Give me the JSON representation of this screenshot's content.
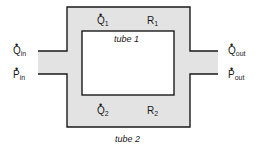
{
  "diagram": {
    "colors": {
      "fill": "#e3e3e3",
      "stroke": "#1a1a1a",
      "background": "#ffffff"
    },
    "tubes": [
      {
        "label": "tube 1",
        "resistance": {
          "symbol": "R",
          "sub": "1"
        },
        "flow": {
          "symbol": "Q",
          "sub": "1"
        }
      },
      {
        "label": "tube 2",
        "resistance": {
          "symbol": "R",
          "sub": "2"
        },
        "flow": {
          "symbol": "Q",
          "sub": "2"
        }
      }
    ],
    "inlet": {
      "flow": {
        "symbol": "Q",
        "sub": "in"
      },
      "pressure": {
        "symbol": "P",
        "sub": "in"
      }
    },
    "outlet": {
      "flow": {
        "symbol": "Q",
        "sub": "out"
      },
      "pressure": {
        "symbol": "P",
        "sub": "out"
      }
    },
    "dot_glyph": "•"
  }
}
